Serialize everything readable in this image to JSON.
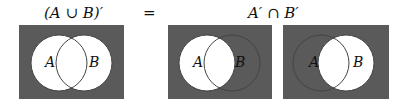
{
  "title_left": "(A ∪ B)′",
  "equals": "=",
  "title_right": "A′ ∩ B′",
  "colors": {
    "shade": "#5a5a5a",
    "outline": "#444444",
    "white": "#ffffff"
  },
  "diagrams": [
    {
      "name": "union-complement",
      "set_a": "A",
      "set_b": "B",
      "shaded": "outside A and B"
    },
    {
      "name": "a-complement",
      "set_a": "A",
      "set_b": "B",
      "shaded": "outside A"
    },
    {
      "name": "b-complement",
      "set_a": "A",
      "set_b": "B",
      "shaded": "outside B"
    }
  ]
}
